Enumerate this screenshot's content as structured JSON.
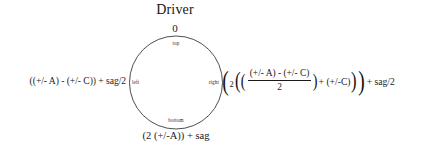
{
  "diagram": {
    "title": "Driver",
    "circle": {
      "inner_labels": {
        "top": "top",
        "bottom": "bottom",
        "left": "left",
        "right": "right"
      },
      "outer_labels": {
        "top": "0",
        "left": "((+/- A) - (+/- C)) + sag/2",
        "bottom": "(2 (+/-A)) + sag"
      },
      "stroke_color": "#3a3a3a"
    },
    "right_expression": {
      "open_paren_outer": "(",
      "coefficient": "2",
      "open_paren_1": "(",
      "open_paren_2": "(",
      "fraction": {
        "numerator": "(+/- A) - (+/- C)",
        "denominator": "2"
      },
      "close_paren_2": ")",
      "plus_term": "+ (+/-C)",
      "close_paren_1": ")",
      "close_paren_outer": ")",
      "tail": "+ sag/2"
    }
  }
}
